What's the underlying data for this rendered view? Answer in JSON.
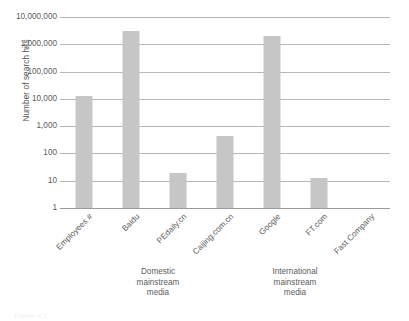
{
  "chart_data": {
    "type": "bar",
    "title": "",
    "xlabel": "",
    "ylabel": "Number of search hits",
    "yscale": "log",
    "ylim": [
      1,
      10000000
    ],
    "grid": true,
    "legend": "none",
    "categories": [
      "Employees #",
      "Baidu",
      "PEdaily.cn",
      "Caijing.com.cn",
      "Google",
      "FT.com",
      "Fast Company"
    ],
    "values": [
      13000,
      3000000,
      20,
      450,
      2000000,
      13,
      1
    ],
    "ytick_labels": [
      "10,000,000",
      "1,000,000",
      "100,000",
      "10,000",
      "1,000",
      "100",
      "10",
      "1"
    ],
    "ytick_values": [
      10000000,
      1000000,
      100000,
      10000,
      1000,
      100,
      10,
      1
    ],
    "groups": [
      {
        "label_lines": [
          "Domestic",
          "mainstream",
          "media"
        ],
        "categories": [
          "Baidu",
          "PEdaily.cn",
          "Caijing.com.cn"
        ]
      },
      {
        "label_lines": [
          "International",
          "mainstream",
          "media"
        ],
        "categories": [
          "Google",
          "FT.com",
          "Fast Company"
        ]
      }
    ],
    "bar_color": "#c6c6c6",
    "gridline_color": "#b7b7b7",
    "axis_color": "#9a9a9a",
    "text_color": "#5b5b5b"
  },
  "caption": "Figure 4.1"
}
